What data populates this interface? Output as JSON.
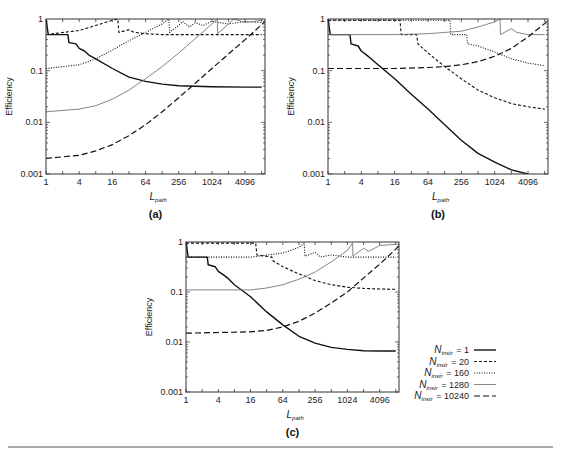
{
  "chart_data": [
    {
      "panel": "(a)",
      "type": "line",
      "xscale": "log2",
      "yscale": "log10",
      "xlabel": "L",
      "xlabel_sub": "path",
      "ylabel": "Efficiency",
      "xlim": [
        1,
        9400
      ],
      "ylim": [
        0.001,
        1
      ],
      "x_ticks": [
        "1",
        "4",
        "16",
        "64",
        "256",
        "1024",
        "4096"
      ],
      "y_ticks": [
        "0.001",
        "0.01",
        "0.1",
        "1"
      ],
      "series": [
        {
          "name": "N_instr = 1",
          "style": "solid-thick",
          "points": [
            [
              1,
              1
            ],
            [
              1.1,
              0.5
            ],
            [
              2.5,
              0.5
            ],
            [
              2.6,
              0.35
            ],
            [
              3.5,
              0.33
            ],
            [
              4,
              0.27
            ],
            [
              5,
              0.24
            ],
            [
              6,
              0.2
            ],
            [
              8,
              0.17
            ],
            [
              16,
              0.11
            ],
            [
              32,
              0.075
            ],
            [
              64,
              0.062
            ],
            [
              128,
              0.055
            ],
            [
              256,
              0.051
            ],
            [
              512,
              0.05
            ],
            [
              1024,
              0.049
            ],
            [
              4096,
              0.048
            ],
            [
              8192,
              0.048
            ]
          ]
        },
        {
          "name": "N_instr = 20",
          "style": "dashed",
          "points": [
            [
              1,
              0.5
            ],
            [
              4,
              0.6
            ],
            [
              8,
              0.75
            ],
            [
              16,
              0.95
            ],
            [
              20,
              1
            ],
            [
              21,
              0.55
            ],
            [
              32,
              0.62
            ],
            [
              40,
              0.55
            ],
            [
              64,
              0.52
            ],
            [
              128,
              0.5
            ],
            [
              256,
              0.5
            ],
            [
              1024,
              0.5
            ],
            [
              8192,
              0.5
            ]
          ]
        },
        {
          "name": "N_instr = 160",
          "style": "dotted",
          "points": [
            [
              1,
              0.11
            ],
            [
              4,
              0.13
            ],
            [
              8,
              0.17
            ],
            [
              16,
              0.25
            ],
            [
              32,
              0.38
            ],
            [
              64,
              0.55
            ],
            [
              128,
              0.8
            ],
            [
              170,
              1
            ],
            [
              175,
              0.55
            ],
            [
              256,
              0.75
            ],
            [
              300,
              0.9
            ],
            [
              400,
              0.7
            ],
            [
              512,
              0.85
            ],
            [
              700,
              0.75
            ],
            [
              1024,
              0.9
            ],
            [
              2048,
              0.8
            ],
            [
              4096,
              0.9
            ],
            [
              8192,
              0.85
            ]
          ]
        },
        {
          "name": "N_instr = 1280",
          "style": "solid-thin-gray",
          "points": [
            [
              1,
              0.016
            ],
            [
              4,
              0.018
            ],
            [
              8,
              0.021
            ],
            [
              16,
              0.028
            ],
            [
              32,
              0.042
            ],
            [
              64,
              0.07
            ],
            [
              128,
              0.12
            ],
            [
              256,
              0.22
            ],
            [
              512,
              0.42
            ],
            [
              1024,
              0.8
            ],
            [
              1280,
              1
            ],
            [
              1300,
              0.52
            ],
            [
              2048,
              0.8
            ],
            [
              2560,
              1
            ],
            [
              4096,
              0.85
            ],
            [
              8192,
              0.95
            ]
          ]
        },
        {
          "name": "N_instr = 10240",
          "style": "long-dashed",
          "points": [
            [
              1,
              0.002
            ],
            [
              4,
              0.0023
            ],
            [
              8,
              0.0028
            ],
            [
              16,
              0.0037
            ],
            [
              32,
              0.0055
            ],
            [
              64,
              0.009
            ],
            [
              128,
              0.016
            ],
            [
              256,
              0.03
            ],
            [
              512,
              0.057
            ],
            [
              1024,
              0.11
            ],
            [
              2048,
              0.21
            ],
            [
              4096,
              0.4
            ],
            [
              8192,
              0.78
            ],
            [
              9400,
              0.9
            ]
          ]
        }
      ]
    },
    {
      "panel": "(b)",
      "type": "line",
      "xscale": "log2",
      "yscale": "log10",
      "xlabel": "L",
      "xlabel_sub": "path",
      "ylabel": "Efficiency",
      "xlim": [
        1,
        9400
      ],
      "ylim": [
        0.001,
        1
      ],
      "x_ticks": [
        "1",
        "4",
        "16",
        "64",
        "256",
        "1024",
        "4096"
      ],
      "y_ticks": [
        "0.001",
        "0.01",
        "0.1",
        "1"
      ],
      "series": [
        {
          "name": "N_instr = 1",
          "style": "solid-thick",
          "points": [
            [
              1,
              1
            ],
            [
              1.1,
              0.5
            ],
            [
              2.5,
              0.5
            ],
            [
              2.6,
              0.33
            ],
            [
              3.5,
              0.3
            ],
            [
              4,
              0.24
            ],
            [
              5,
              0.2
            ],
            [
              6,
              0.17
            ],
            [
              8,
              0.13
            ],
            [
              16,
              0.07
            ],
            [
              32,
              0.035
            ],
            [
              64,
              0.018
            ],
            [
              128,
              0.009
            ],
            [
              256,
              0.0045
            ],
            [
              512,
              0.0025
            ],
            [
              1024,
              0.0017
            ],
            [
              2048,
              0.0012
            ],
            [
              4096,
              0.001
            ]
          ]
        },
        {
          "name": "N_instr = 20",
          "style": "dashed",
          "points": [
            [
              1,
              0.95
            ],
            [
              20,
              0.95
            ],
            [
              21,
              0.5
            ],
            [
              40,
              0.5
            ],
            [
              42,
              0.33
            ],
            [
              64,
              0.22
            ],
            [
              128,
              0.12
            ],
            [
              256,
              0.07
            ],
            [
              512,
              0.042
            ],
            [
              1024,
              0.03
            ],
            [
              2048,
              0.023
            ],
            [
              4096,
              0.02
            ],
            [
              8192,
              0.018
            ]
          ]
        },
        {
          "name": "N_instr = 160",
          "style": "dotted",
          "points": [
            [
              1,
              0.95
            ],
            [
              160,
              0.95
            ],
            [
              165,
              0.5
            ],
            [
              320,
              0.5
            ],
            [
              330,
              0.33
            ],
            [
              512,
              0.3
            ],
            [
              1024,
              0.23
            ],
            [
              2048,
              0.17
            ],
            [
              4096,
              0.14
            ],
            [
              8192,
              0.125
            ]
          ]
        },
        {
          "name": "N_instr = 1280",
          "style": "solid-thin-gray",
          "points": [
            [
              1,
              0.5
            ],
            [
              16,
              0.5
            ],
            [
              64,
              0.52
            ],
            [
              256,
              0.58
            ],
            [
              512,
              0.7
            ],
            [
              1024,
              0.88
            ],
            [
              1280,
              1
            ],
            [
              1300,
              0.5
            ],
            [
              2048,
              0.65
            ],
            [
              2560,
              0.55
            ],
            [
              4096,
              0.5
            ],
            [
              8192,
              0.5
            ]
          ]
        },
        {
          "name": "N_instr = 10240",
          "style": "long-dashed",
          "points": [
            [
              1,
              0.11
            ],
            [
              16,
              0.11
            ],
            [
              64,
              0.115
            ],
            [
              128,
              0.12
            ],
            [
              256,
              0.13
            ],
            [
              512,
              0.15
            ],
            [
              1024,
              0.19
            ],
            [
              2048,
              0.27
            ],
            [
              4096,
              0.45
            ],
            [
              8192,
              0.82
            ],
            [
              9400,
              0.95
            ]
          ]
        }
      ]
    },
    {
      "panel": "(c)",
      "type": "line",
      "xscale": "log2",
      "yscale": "log10",
      "xlabel": "L",
      "xlabel_sub": "path",
      "ylabel": "Efficiency",
      "xlim": [
        1,
        9400
      ],
      "ylim": [
        0.001,
        1
      ],
      "x_ticks": [
        "1",
        "4",
        "16",
        "64",
        "256",
        "1024",
        "4096"
      ],
      "y_ticks": [
        "0.001",
        "0.01",
        "0.1",
        "1"
      ],
      "series": [
        {
          "name": "N_instr = 1",
          "style": "solid-thick",
          "points": [
            [
              1,
              1
            ],
            [
              1.1,
              0.5
            ],
            [
              2.5,
              0.5
            ],
            [
              2.6,
              0.35
            ],
            [
              3.5,
              0.32
            ],
            [
              4,
              0.26
            ],
            [
              5,
              0.22
            ],
            [
              6,
              0.19
            ],
            [
              8,
              0.14
            ],
            [
              16,
              0.08
            ],
            [
              32,
              0.04
            ],
            [
              64,
              0.022
            ],
            [
              128,
              0.013
            ],
            [
              256,
              0.0095
            ],
            [
              512,
              0.0078
            ],
            [
              1024,
              0.0071
            ],
            [
              2048,
              0.0067
            ],
            [
              4096,
              0.0066
            ],
            [
              8192,
              0.0066
            ]
          ]
        },
        {
          "name": "N_instr = 20",
          "style": "dashed",
          "points": [
            [
              1,
              0.95
            ],
            [
              20,
              0.95
            ],
            [
              21,
              0.55
            ],
            [
              40,
              0.5
            ],
            [
              42,
              0.42
            ],
            [
              64,
              0.32
            ],
            [
              128,
              0.23
            ],
            [
              256,
              0.17
            ],
            [
              512,
              0.14
            ],
            [
              1024,
              0.125
            ],
            [
              2048,
              0.118
            ],
            [
              4096,
              0.115
            ],
            [
              8192,
              0.113
            ]
          ]
        },
        {
          "name": "N_instr = 160",
          "style": "dotted",
          "points": [
            [
              1,
              0.5
            ],
            [
              16,
              0.5
            ],
            [
              64,
              0.6
            ],
            [
              128,
              0.78
            ],
            [
              160,
              0.95
            ],
            [
              165,
              0.52
            ],
            [
              256,
              0.62
            ],
            [
              320,
              0.5
            ],
            [
              512,
              0.55
            ],
            [
              1024,
              0.5
            ],
            [
              8192,
              0.5
            ]
          ]
        },
        {
          "name": "N_instr = 1280",
          "style": "solid-thin-gray",
          "points": [
            [
              1,
              0.11
            ],
            [
              16,
              0.11
            ],
            [
              32,
              0.12
            ],
            [
              64,
              0.14
            ],
            [
              128,
              0.18
            ],
            [
              256,
              0.25
            ],
            [
              512,
              0.4
            ],
            [
              1024,
              0.68
            ],
            [
              1280,
              0.95
            ],
            [
              1300,
              0.52
            ],
            [
              2048,
              0.75
            ],
            [
              2560,
              0.65
            ],
            [
              4096,
              0.85
            ],
            [
              8192,
              0.9
            ]
          ]
        },
        {
          "name": "N_instr = 10240",
          "style": "long-dashed",
          "points": [
            [
              1,
              0.015
            ],
            [
              16,
              0.016
            ],
            [
              32,
              0.017
            ],
            [
              64,
              0.02
            ],
            [
              128,
              0.026
            ],
            [
              256,
              0.038
            ],
            [
              512,
              0.06
            ],
            [
              1024,
              0.1
            ],
            [
              2048,
              0.19
            ],
            [
              4096,
              0.36
            ],
            [
              8192,
              0.72
            ],
            [
              9400,
              0.85
            ]
          ]
        }
      ]
    }
  ],
  "panels": [
    {
      "label": "(a)",
      "frame": {
        "x": 46,
        "y": 19,
        "w": 219,
        "h": 155
      }
    },
    {
      "label": "(b)",
      "frame": {
        "x": 328,
        "y": 19,
        "w": 220,
        "h": 155
      }
    },
    {
      "label": "(c)",
      "frame": {
        "x": 186,
        "y": 242,
        "w": 213,
        "h": 150
      }
    }
  ],
  "axis": {
    "ylabel": "Efficiency",
    "xlabel_main": "L",
    "xlabel_sub": "path",
    "x_ticks": [
      {
        "v": 1,
        "label": "1"
      },
      {
        "v": 4,
        "label": "4"
      },
      {
        "v": 16,
        "label": "16"
      },
      {
        "v": 64,
        "label": "64"
      },
      {
        "v": 256,
        "label": "256"
      },
      {
        "v": 1024,
        "label": "1024"
      },
      {
        "v": 4096,
        "label": "4096"
      }
    ],
    "y_ticks": [
      {
        "v": 0.001,
        "label": "0.001"
      },
      {
        "v": 0.01,
        "label": "0.01"
      },
      {
        "v": 0.1,
        "label": "0.1"
      },
      {
        "v": 1,
        "label": "1"
      }
    ],
    "xmax": 9400
  },
  "legend": {
    "items": [
      {
        "main": "N",
        "sub": "instr",
        "value": "= 1",
        "style": "solid-thick"
      },
      {
        "main": "N",
        "sub": "instr",
        "value": "= 20",
        "style": "dashed"
      },
      {
        "main": "N",
        "sub": "instr",
        "value": "= 160",
        "style": "dotted"
      },
      {
        "main": "N",
        "sub": "instr",
        "value": "= 1280",
        "style": "solid-thin-gray"
      },
      {
        "main": "N",
        "sub": "instr",
        "value": "= 10240",
        "style": "long-dashed"
      }
    ]
  },
  "colors": {
    "frame": "#333333",
    "line_dark": "#111111",
    "line_gray": "#777777",
    "rule": "#555555"
  }
}
